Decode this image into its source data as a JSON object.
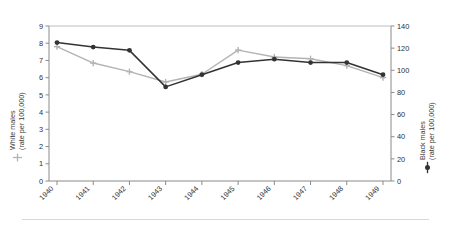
{
  "chart_data": {
    "type": "line",
    "title": "",
    "xlabel": "",
    "categories": [
      "1940",
      "1941",
      "1942",
      "1943",
      "1944",
      "1945",
      "1946",
      "1947",
      "1948",
      "1949"
    ],
    "grid": false,
    "legend": "axis-titles",
    "axes": {
      "left": {
        "label_line1": "White males",
        "label_line2": "(rate per 100,000)",
        "ticks": [
          0,
          1,
          2,
          3,
          4,
          5,
          6,
          7,
          8,
          9
        ],
        "ylim": [
          0,
          9
        ],
        "marker": "plus-gray"
      },
      "right": {
        "label_line1": "Black males",
        "label_line2": "(rate per 100,000)",
        "ticks": [
          0,
          20,
          40,
          60,
          80,
          100,
          120,
          140
        ],
        "ylim": [
          0,
          140
        ],
        "marker": "circle-dark"
      }
    },
    "series": [
      {
        "name": "White males",
        "axis": "left",
        "color": "#b3b3b3",
        "marker": "plus",
        "values": [
          7.8,
          6.85,
          6.35,
          5.75,
          6.2,
          7.6,
          7.2,
          7.1,
          6.7,
          6.0
        ]
      },
      {
        "name": "Black males",
        "axis": "right",
        "color": "#333333",
        "marker": "circle",
        "values": [
          125,
          121,
          118,
          85,
          96,
          107,
          110,
          107,
          107,
          96
        ]
      }
    ]
  },
  "colors": {
    "white_males_line": "#b3b3b3",
    "black_males_line": "#333333",
    "axis": "#808080",
    "text": "#2f2f2f",
    "rule": "#d8d8d8"
  }
}
